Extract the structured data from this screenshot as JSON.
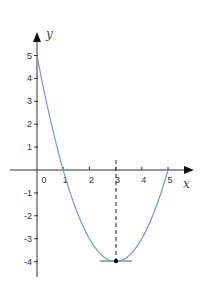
{
  "chart_data": {
    "type": "line",
    "title": "",
    "xlabel": "x",
    "ylabel": "y",
    "function": "y = x^2 - 6x + 5",
    "x": [
      0,
      0.5,
      1,
      1.5,
      2,
      2.5,
      3,
      3.5,
      4,
      4.5,
      5
    ],
    "series": [
      {
        "name": "parabola",
        "values": [
          5,
          2.25,
          0,
          -1.75,
          -3,
          -3.75,
          -4,
          -3.75,
          -3,
          -1.75,
          0
        ],
        "color": "#6a9bd8"
      }
    ],
    "x_ticks": [
      "0",
      "1",
      "2",
      "3",
      "4",
      "5"
    ],
    "y_ticks": [
      "5",
      "4",
      "3",
      "2",
      "1",
      "-1",
      "-2",
      "-3",
      "-4"
    ],
    "xlim": [
      -1,
      6
    ],
    "ylim": [
      -4.5,
      5.6
    ],
    "grid": false,
    "legend": null,
    "annotations": [
      {
        "type": "point",
        "x": 3,
        "y": -4,
        "label": "vertex"
      },
      {
        "type": "dashed-vertical",
        "x": 3,
        "from_y": -4,
        "to_y": 0.5
      },
      {
        "type": "horizontal-tangent",
        "y": -4,
        "from_x": 2.4,
        "to_x": 3.6
      }
    ]
  },
  "axes": {
    "x_label": "x",
    "y_label": "y",
    "origin_label": "0"
  }
}
